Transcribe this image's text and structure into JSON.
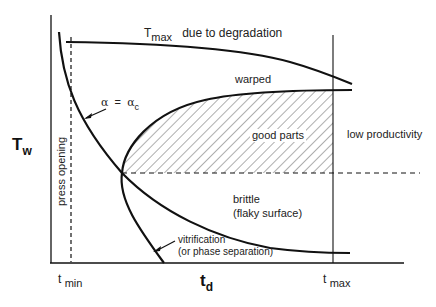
{
  "diagram": {
    "y_axis": {
      "label_main": "T",
      "label_sub": "w"
    },
    "x_axis": {
      "label_main": "t",
      "label_sub": "d"
    },
    "ticks": {
      "tmin": {
        "main": "t",
        "sub": "min"
      },
      "tmax": {
        "main": "t",
        "sub": "max"
      }
    },
    "curves": {
      "tmax_curve": {
        "main": "T",
        "sub": "max",
        "suffix": "due to degradation"
      },
      "gel_curve": {
        "alpha": "α",
        "equals": "=",
        "alpha_c": "α",
        "sub": "c"
      },
      "vitrification": {
        "line1": "vitrification",
        "line2": "(or phase separation)"
      }
    },
    "regions": {
      "warped": "warped",
      "good_parts": "good parts",
      "low_productivity": "low productivity",
      "brittle_line1": "brittle",
      "brittle_line2": "(flaky surface)"
    },
    "press_opening": "press opening",
    "colors": {
      "line": "#111111",
      "hatch": "#333333",
      "text": "#222222"
    }
  }
}
